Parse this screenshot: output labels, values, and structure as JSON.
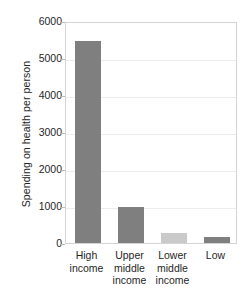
{
  "chart_data": {
    "type": "bar",
    "title": "",
    "xlabel": "",
    "ylabel": "Spending on health per person",
    "categories": [
      "High income",
      "Upper middle income",
      "Lower middle income",
      "Low"
    ],
    "category_lines": [
      [
        "High",
        "income"
      ],
      [
        "Upper",
        "middle",
        "income"
      ],
      [
        "Lower",
        "middle",
        "income"
      ],
      [
        "Low"
      ]
    ],
    "values": [
      5450,
      970,
      275,
      150
    ],
    "ylim": [
      0,
      6000
    ],
    "yticks": [
      0,
      1000,
      2000,
      3000,
      4000,
      5000,
      6000
    ],
    "ytick_labels": [
      "0",
      "1000",
      "2000",
      "3000",
      "4000",
      "5000",
      "6000"
    ],
    "grid": true,
    "legend": "none",
    "bar_colors": [
      "#7f7f7f",
      "#7f7f7f",
      "#cacaca",
      "#7f7f7f"
    ]
  },
  "style": {
    "frame_color": "#d4d4d4",
    "grid_color": "#ececec",
    "text_color": "#1f1f1f",
    "background": "#ffffff"
  }
}
